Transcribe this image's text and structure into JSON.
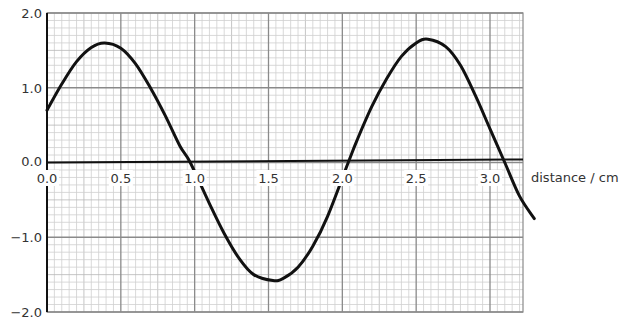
{
  "chart_data": {
    "type": "line",
    "title": "",
    "xlabel": "distance / cm",
    "ylabel": "",
    "xlim": [
      0.0,
      3.3
    ],
    "ylim": [
      -2.0,
      2.0
    ],
    "grid": true,
    "grid_minor_x": 0.05,
    "grid_minor_y": 0.1,
    "x_ticks": [
      {
        "value": 0.0,
        "label": "0.0"
      },
      {
        "value": 0.5,
        "label": "0.5"
      },
      {
        "value": 1.0,
        "label": "1.0"
      },
      {
        "value": 1.5,
        "label": "1.5"
      },
      {
        "value": 2.0,
        "label": "2.0"
      },
      {
        "value": 2.5,
        "label": "2.5"
      },
      {
        "value": 3.0,
        "label": "3.0"
      }
    ],
    "y_ticks": [
      {
        "value": 2.0,
        "label": "2.0"
      },
      {
        "value": 1.0,
        "label": "1.0"
      },
      {
        "value": 0.0,
        "label": "0.0"
      },
      {
        "value": -1.0,
        "label": "−1.0"
      },
      {
        "value": -2.0,
        "label": "−2.0"
      }
    ],
    "series": [
      {
        "name": "wave",
        "color": "#111111",
        "x": [
          0.0,
          0.1,
          0.2,
          0.3,
          0.39,
          0.5,
          0.6,
          0.7,
          0.8,
          0.9,
          0.97,
          1.1,
          1.2,
          1.3,
          1.4,
          1.53,
          1.6,
          1.7,
          1.8,
          1.9,
          2.04,
          2.1,
          2.2,
          2.3,
          2.4,
          2.5,
          2.58,
          2.7,
          2.8,
          2.9,
          3.0,
          3.1,
          3.2,
          3.3
        ],
        "y": [
          0.7,
          1.05,
          1.35,
          1.54,
          1.6,
          1.53,
          1.32,
          1.0,
          0.63,
          0.22,
          0.0,
          -0.55,
          -0.95,
          -1.28,
          -1.5,
          -1.58,
          -1.55,
          -1.4,
          -1.12,
          -0.72,
          0.0,
          0.3,
          0.75,
          1.12,
          1.42,
          1.6,
          1.65,
          1.55,
          1.3,
          0.9,
          0.45,
          0.0,
          -0.45,
          -0.75
        ]
      }
    ]
  }
}
